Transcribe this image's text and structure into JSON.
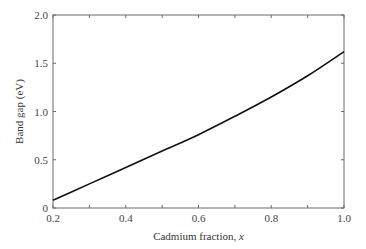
{
  "chart_data": {
    "type": "line",
    "title": "",
    "xlabel": "Cadmium fraction, x",
    "xlabel_main": "Cadmium fraction, ",
    "xlabel_var": "x",
    "ylabel": "Band gap (eV)",
    "xlim": [
      0.2,
      1.0
    ],
    "ylim": [
      0,
      2.0
    ],
    "grid": false,
    "legend": null,
    "x_ticks": [
      0.2,
      0.4,
      0.6,
      0.8,
      1.0
    ],
    "x_tick_labels": [
      "0.2",
      "0.4",
      "0.6",
      "0.8",
      "1.0"
    ],
    "x_minor_ticks": [
      0.3,
      0.5,
      0.7,
      0.9
    ],
    "y_ticks": [
      0,
      0.5,
      1.0,
      1.5,
      2.0
    ],
    "y_tick_labels": [
      "0",
      "0.5",
      "1.0",
      "1.5",
      "2.0"
    ],
    "series": [
      {
        "name": "Band gap",
        "x": [
          0.2,
          0.3,
          0.4,
          0.5,
          0.6,
          0.7,
          0.8,
          0.9,
          1.0
        ],
        "values": [
          0.08,
          0.25,
          0.42,
          0.59,
          0.76,
          0.95,
          1.15,
          1.37,
          1.62
        ],
        "color": "#111111"
      }
    ]
  }
}
